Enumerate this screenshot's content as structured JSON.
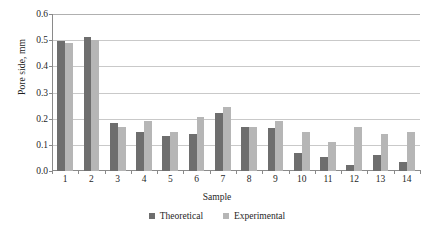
{
  "chart_data": {
    "type": "bar",
    "title": "",
    "subtitle": "",
    "xlabel": "Sample",
    "ylabel": "Pore side, mm",
    "categories": [
      "1",
      "2",
      "3",
      "4",
      "5",
      "6",
      "7",
      "8",
      "9",
      "10",
      "11",
      "12",
      "13",
      "14"
    ],
    "series": [
      {
        "name": "Theoretical",
        "color": "#6e6e6e",
        "values": [
          0.497,
          0.513,
          0.185,
          0.148,
          0.135,
          0.141,
          0.22,
          0.168,
          0.165,
          0.068,
          0.055,
          0.022,
          0.062,
          0.033
        ]
      },
      {
        "name": "Experimental",
        "color": "#b6b6b6",
        "values": [
          0.489,
          0.5,
          0.17,
          0.193,
          0.149,
          0.207,
          0.245,
          0.168,
          0.193,
          0.15,
          0.11,
          0.17,
          0.143,
          0.15
        ]
      }
    ],
    "ylim": [
      0.0,
      0.6
    ],
    "ytick_values": [
      0.0,
      0.1,
      0.2,
      0.3,
      0.4,
      0.5,
      0.6
    ],
    "ytick_labels": [
      "0.0",
      "0.1",
      "0.2",
      "0.3",
      "0.4",
      "0.5",
      "0.6"
    ],
    "grid": "horizontal",
    "grid_color": "#c9c9c9",
    "legend_position": "bottom",
    "legend_entries": [
      "Theoretical",
      "Experimental"
    ],
    "axis_color": "#8a8a8a",
    "background": "#ffffff"
  }
}
